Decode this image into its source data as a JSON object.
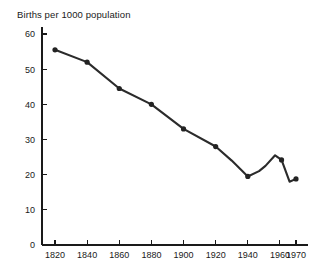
{
  "chart_data": {
    "type": "line",
    "title": "Births per 1000 population",
    "xlabel": "",
    "ylabel": "",
    "xlim": [
      1810,
      1975
    ],
    "ylim": [
      0,
      62
    ],
    "grid": false,
    "legend": "none",
    "x_ticks": [
      1820,
      1840,
      1860,
      1880,
      1900,
      1920,
      1940,
      1960,
      1970
    ],
    "x_tick_labels": [
      "1820",
      "1840",
      "1860",
      "1880",
      "1900",
      "1920",
      "1940",
      "1960",
      "1970"
    ],
    "y_ticks": [
      0,
      10,
      20,
      30,
      40,
      50,
      60
    ],
    "y_tick_labels": [
      "0",
      "10",
      "20",
      "30",
      "40",
      "50",
      "60"
    ],
    "series": [
      {
        "name": "Births per 1000 population",
        "color": "#2b2b2b",
        "marker": "circle",
        "x": [
          1820,
          1840,
          1860,
          1880,
          1900,
          1920,
          1930,
          1940,
          1947,
          1951,
          1957,
          1961,
          1966,
          1970
        ],
        "values": [
          55.5,
          52.0,
          44.5,
          40.0,
          33.0,
          28.0,
          24.0,
          19.5,
          21.0,
          22.5,
          25.5,
          24.2,
          18.0,
          18.8
        ],
        "marked_points": [
          {
            "x": 1820,
            "y": 55.5
          },
          {
            "x": 1840,
            "y": 52.0
          },
          {
            "x": 1860,
            "y": 44.5
          },
          {
            "x": 1880,
            "y": 40.0
          },
          {
            "x": 1900,
            "y": 33.0
          },
          {
            "x": 1920,
            "y": 28.0
          },
          {
            "x": 1940,
            "y": 19.5
          },
          {
            "x": 1961,
            "y": 24.2
          },
          {
            "x": 1970,
            "y": 18.8
          }
        ]
      }
    ]
  }
}
